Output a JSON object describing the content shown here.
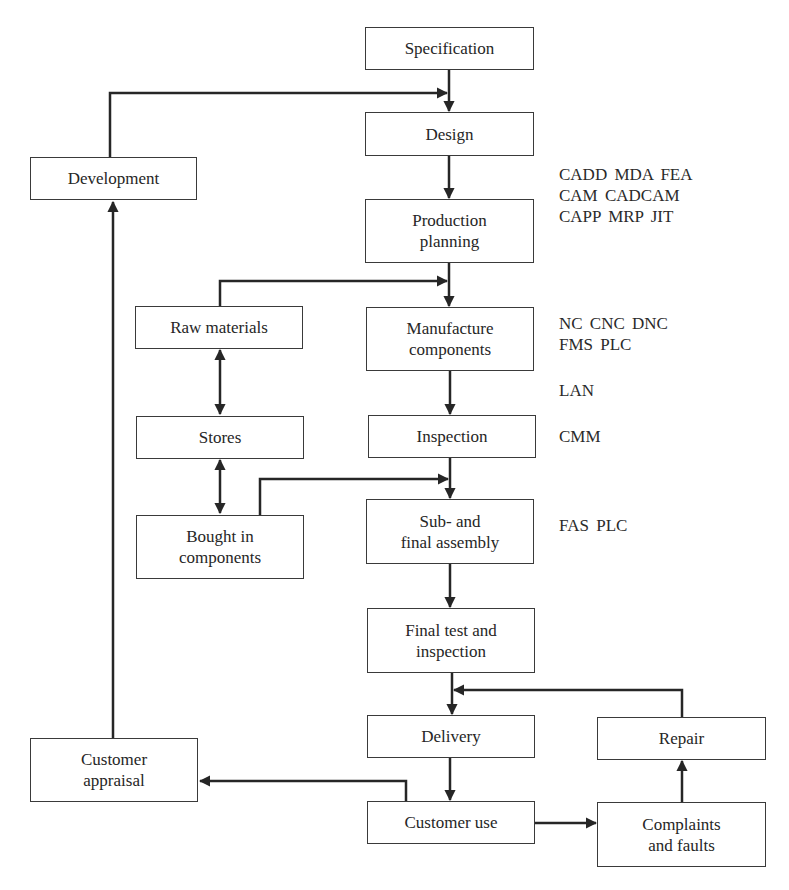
{
  "diagram": {
    "type": "flowchart",
    "theme": {
      "line_color": "#262626",
      "border_color": "#3a3a3a",
      "text_color": "#262626",
      "background": "#ffffff"
    },
    "boxes": {
      "specification": {
        "label": "Specification"
      },
      "design": {
        "label": "Design"
      },
      "development": {
        "label": "Development"
      },
      "production_planning": {
        "label": "Production\nplanning"
      },
      "raw_materials": {
        "label": "Raw materials"
      },
      "manufacture_components": {
        "label": "Manufacture\ncomponents"
      },
      "stores": {
        "label": "Stores"
      },
      "inspection": {
        "label": "Inspection"
      },
      "bought_in_components": {
        "label": "Bought in\ncomponents"
      },
      "sub_final_assembly": {
        "label": "Sub- and\nfinal assembly"
      },
      "final_test": {
        "label": "Final test and\ninspection"
      },
      "delivery": {
        "label": "Delivery"
      },
      "repair": {
        "label": "Repair"
      },
      "customer_appraisal": {
        "label": "Customer\nappraisal"
      },
      "customer_use": {
        "label": "Customer use"
      },
      "complaints_faults": {
        "label": "Complaints\nand faults"
      }
    },
    "technology_labels": {
      "design_planning": "CADD  MDA  FEA\nCAM  CADCAM\nCAPP  MRP  JIT",
      "manufacture": "NC  CNC  DNC\nFMS  PLC",
      "network": "LAN",
      "inspection": "CMM",
      "assembly": "FAS  PLC"
    },
    "connections": [
      {
        "from": "Specification",
        "to": "Design"
      },
      {
        "from": "Development",
        "to": "Design"
      },
      {
        "from": "Design",
        "to": "Production planning"
      },
      {
        "from": "Production planning",
        "to": "Manufacture components"
      },
      {
        "from": "Raw materials",
        "to": "Manufacture components"
      },
      {
        "from": "Raw materials",
        "to": "Stores",
        "bidirectional": true
      },
      {
        "from": "Stores",
        "to": "Bought in components",
        "bidirectional": true
      },
      {
        "from": "Manufacture components",
        "to": "Inspection"
      },
      {
        "from": "Inspection",
        "to": "Sub- and final assembly"
      },
      {
        "from": "Bought in components",
        "to": "Sub- and final assembly"
      },
      {
        "from": "Sub- and final assembly",
        "to": "Final test and inspection"
      },
      {
        "from": "Final test and inspection",
        "to": "Delivery"
      },
      {
        "from": "Repair",
        "to": "Delivery"
      },
      {
        "from": "Delivery",
        "to": "Customer use"
      },
      {
        "from": "Customer use",
        "to": "Customer appraisal"
      },
      {
        "from": "Customer use",
        "to": "Complaints and faults"
      },
      {
        "from": "Complaints and faults",
        "to": "Repair"
      },
      {
        "from": "Customer appraisal",
        "to": "Development"
      }
    ]
  }
}
